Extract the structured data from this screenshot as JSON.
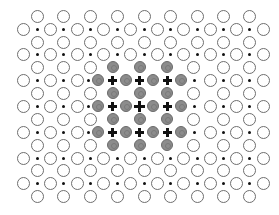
{
  "diagram": {
    "colors": {
      "background": "#ffffff",
      "open_circle_stroke": "#6e6e6e",
      "dot": "#111111",
      "gray_fill": "#8c8c8c",
      "gray_stroke": "#6a6a6a",
      "plus": "#111111"
    },
    "rows": [
      {
        "y": 16,
        "type": "odd"
      },
      {
        "y": 29,
        "type": "even"
      },
      {
        "y": 42,
        "type": "odd"
      },
      {
        "y": 54,
        "type": "even"
      },
      {
        "y": 67,
        "type": "odd-gray"
      },
      {
        "y": 80,
        "type": "even-gray"
      },
      {
        "y": 93,
        "type": "odd-gray"
      },
      {
        "y": 106,
        "type": "even-gray-center"
      },
      {
        "y": 119,
        "type": "odd-gray"
      },
      {
        "y": 132,
        "type": "even-gray"
      },
      {
        "y": 145,
        "type": "odd-gray"
      },
      {
        "y": 158,
        "type": "even"
      },
      {
        "y": 170,
        "type": "odd"
      },
      {
        "y": 183,
        "type": "even"
      },
      {
        "y": 196,
        "type": "odd"
      }
    ],
    "odd_row_circle_x": [
      37,
      63,
      90,
      117,
      144,
      170,
      197,
      223,
      249
    ],
    "even_row_circle_x": [
      23,
      50,
      77,
      103,
      130,
      157,
      183,
      210,
      236,
      263
    ],
    "even_row_dot_x": [
      37,
      63,
      90,
      117,
      144,
      170,
      197,
      223,
      249
    ],
    "odd_gray_row": {
      "open_x": [
        37,
        63,
        90,
        193,
        223,
        249
      ],
      "gray_x": [
        113,
        140,
        167
      ]
    },
    "even_gray_row": {
      "open_x": [
        23,
        50,
        77,
        210,
        236,
        263
      ],
      "dot_x": [
        37,
        63,
        88,
        194,
        223,
        249
      ],
      "gray_x": [
        98,
        126,
        153,
        181
      ],
      "plus_x": [
        112,
        139.5,
        167
      ]
    }
  }
}
